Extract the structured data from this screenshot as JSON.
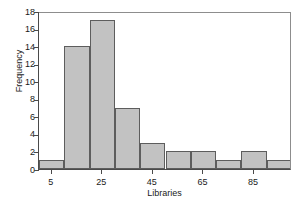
{
  "chart_data": {
    "type": "bar",
    "title": "",
    "xlabel": "Libraries",
    "ylabel": "Frequency",
    "categories": [
      "0-10",
      "10-20",
      "20-30",
      "30-40",
      "40-50",
      "50-60",
      "60-70",
      "70-80",
      "80-90",
      "90-100"
    ],
    "bin_starts": [
      0,
      10,
      20,
      30,
      40,
      50,
      60,
      70,
      80,
      90
    ],
    "bin_width": 10,
    "values": [
      1,
      14,
      17,
      7,
      3,
      2,
      2,
      1,
      2,
      1
    ],
    "xlim": [
      0,
      100
    ],
    "ylim": [
      0,
      18
    ],
    "x_ticks": [
      5,
      25,
      45,
      65,
      85
    ],
    "x_tick_labels": [
      "5",
      "25",
      "45",
      "65",
      "85"
    ],
    "y_ticks": [
      0,
      2,
      4,
      6,
      8,
      10,
      12,
      14,
      16,
      18
    ],
    "y_tick_labels": [
      "0",
      "2",
      "4",
      "6",
      "8",
      "10",
      "12",
      "14",
      "16",
      "18"
    ],
    "grid": false,
    "legend": null,
    "bar_fill_color": "#c2c2c2",
    "bar_edge_color": "#5d5d5d",
    "axis_color": "#4a4a4a",
    "text_color": "#1a1a1a",
    "background_color": "#ffffff"
  }
}
